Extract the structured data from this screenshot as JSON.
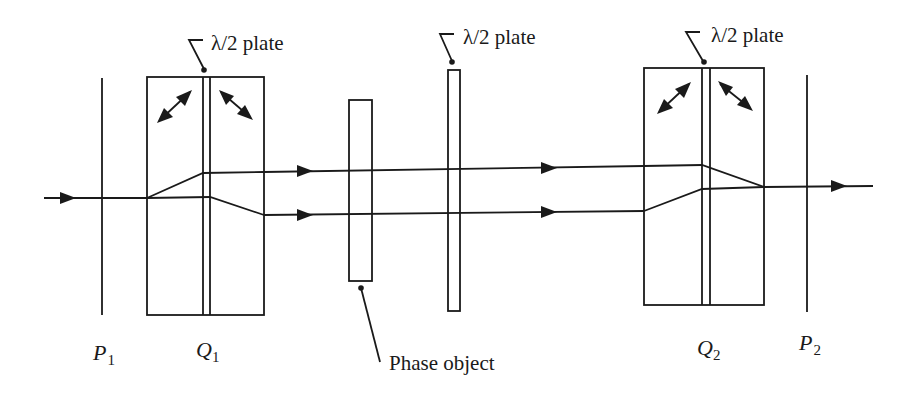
{
  "diagram": {
    "type": "optical-setup",
    "colors": {
      "line": "#1a1a1a",
      "background": "#ffffff"
    },
    "labels": {
      "plate_left": "λ/2 plate",
      "plate_middle": "λ/2 plate",
      "plate_right": "λ/2 plate",
      "phase_object": "Phase object",
      "p1_letter": "P",
      "p1_sub": "1",
      "q1_letter": "Q",
      "q1_sub": "1",
      "q2_letter": "Q",
      "q2_sub": "2",
      "p2_letter": "P",
      "p2_sub": "2"
    },
    "components": [
      {
        "id": "P1",
        "kind": "polarizer"
      },
      {
        "id": "Q1",
        "kind": "birefringent-displacer-with-half-wave-plate"
      },
      {
        "id": "phase-object",
        "kind": "sample"
      },
      {
        "id": "half-wave-plate",
        "kind": "half-wave-plate"
      },
      {
        "id": "Q2",
        "kind": "birefringent-displacer-with-half-wave-plate"
      },
      {
        "id": "P2",
        "kind": "polarizer"
      }
    ]
  }
}
